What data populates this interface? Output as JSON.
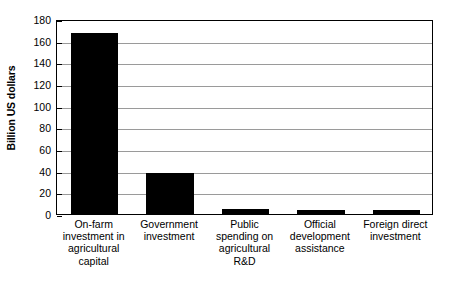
{
  "chart_data": {
    "type": "bar",
    "title": "",
    "subtitle": "",
    "xlabel": "",
    "ylabel": "Billion US dollars",
    "ylim": [
      0,
      180
    ],
    "ytick_step": 20,
    "yticks": [
      0,
      20,
      40,
      60,
      80,
      100,
      120,
      140,
      160,
      180
    ],
    "ytick_labels": [
      "0",
      "20",
      "40",
      "60",
      "80",
      "100",
      "120",
      "140",
      "160",
      "180"
    ],
    "grid": "horizontal",
    "legend": "none",
    "bar_color": "#000000",
    "gridline_color": "#9a9a9a",
    "frame_color": "#000000",
    "categories": [
      "On-farm investment in agricultural capital",
      "Government investment",
      "Public spending on agricultural R&D",
      "Official development assistance",
      "Foreign direct investment"
    ],
    "values": [
      167,
      38,
      5,
      4,
      4
    ]
  }
}
